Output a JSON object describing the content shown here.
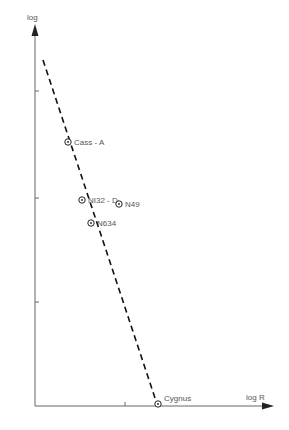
{
  "chart_data": {
    "type": "scatter",
    "title": "",
    "xlabel": "log R",
    "ylabel": "log",
    "grid": false,
    "legend": null,
    "axis_pixels": {
      "origin": [
        35,
        406
      ],
      "x_end": 273,
      "y_end": 25
    },
    "x_ticks_px": [
      125
    ],
    "y_ticks_px": [
      91,
      198,
      302
    ],
    "points": [
      {
        "label": "Cass - A",
        "px": [
          68,
          142
        ]
      },
      {
        "label": "NI32 - D",
        "px": [
          82,
          200
        ]
      },
      {
        "label": "N49",
        "px": [
          119,
          204
        ]
      },
      {
        "label": "N634",
        "px": [
          91,
          223
        ]
      },
      {
        "label": "Cygnus",
        "px": [
          158,
          404
        ]
      }
    ],
    "fit_line": {
      "style": "dashed",
      "from_px": [
        43,
        60
      ],
      "to_px": [
        157,
        404
      ]
    },
    "annotations": [
      "Cass - A",
      "NI32 - D",
      "N49",
      "N634",
      "Cygnus"
    ]
  }
}
